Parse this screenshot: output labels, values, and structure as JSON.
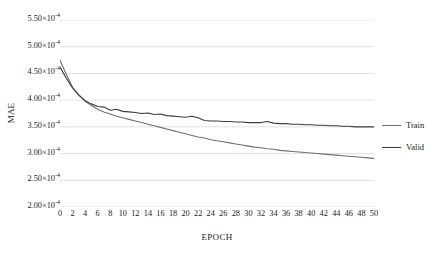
{
  "chart_data": {
    "type": "line",
    "title": "",
    "xlabel": "EPOCH",
    "ylabel": "MAE",
    "xlim": [
      0,
      50
    ],
    "ylim": [
      0.0002,
      0.00055
    ],
    "grid": "horizontal",
    "legend_position": "right",
    "y_tick_labels": [
      "5.50×10",
      "5.00×10",
      "4.50×10",
      "4.00×10",
      "3.50×10",
      "3.00×10",
      "2.50×10",
      "2.00×10"
    ],
    "y_tick_exponent": "-4",
    "y_tick_values": [
      0.00055,
      0.0005,
      0.00045,
      0.0004,
      0.00035,
      0.0003,
      0.00025,
      0.0002
    ],
    "x_tick_labels": [
      "0",
      "2",
      "4",
      "6",
      "8",
      "10",
      "12",
      "14",
      "16",
      "18",
      "20",
      "22",
      "24",
      "26",
      "28",
      "30",
      "32",
      "34",
      "36",
      "38",
      "40",
      "42",
      "44",
      "46",
      "48",
      "50"
    ],
    "x": [
      0,
      1,
      2,
      3,
      4,
      5,
      6,
      7,
      8,
      9,
      10,
      11,
      12,
      13,
      14,
      15,
      16,
      17,
      18,
      19,
      20,
      21,
      22,
      23,
      24,
      25,
      26,
      27,
      28,
      29,
      30,
      31,
      32,
      33,
      34,
      35,
      36,
      37,
      38,
      39,
      40,
      41,
      42,
      43,
      44,
      45,
      46,
      47,
      48,
      49,
      50
    ],
    "series": [
      {
        "name": "Train",
        "color": "#6f6f6f",
        "values": [
          0.000475,
          0.000448,
          0.000424,
          0.000409,
          0.000398,
          0.00039,
          0.000383,
          0.000378,
          0.000374,
          0.00037,
          0.000367,
          0.000364,
          0.000361,
          0.000358,
          0.000355,
          0.000352,
          0.000349,
          0.000346,
          0.000343,
          0.00034,
          0.000337,
          0.000334,
          0.000331,
          0.000329,
          0.000326,
          0.000324,
          0.000322,
          0.00032,
          0.000318,
          0.000316,
          0.000314,
          0.000312,
          0.000311,
          0.000309,
          0.000308,
          0.000306,
          0.000305,
          0.000304,
          0.000303,
          0.000302,
          0.000301,
          0.0003,
          0.000299,
          0.000298,
          0.000297,
          0.000296,
          0.000295,
          0.000294,
          0.000293,
          0.000292,
          0.000291
        ]
      },
      {
        "name": "Valid",
        "color": "#3c3c3c",
        "values": [
          0.000462,
          0.000441,
          0.000423,
          0.00041,
          0.000399,
          0.000393,
          0.000388,
          0.000387,
          0.000381,
          0.000383,
          0.000379,
          0.000378,
          0.000377,
          0.000375,
          0.000376,
          0.000373,
          0.000374,
          0.000371,
          0.00037,
          0.000369,
          0.000368,
          0.00037,
          0.000367,
          0.000362,
          0.000361,
          0.000361,
          0.00036,
          0.00036,
          0.000359,
          0.000359,
          0.000358,
          0.000358,
          0.000358,
          0.00036,
          0.000357,
          0.000356,
          0.000356,
          0.000355,
          0.000355,
          0.000354,
          0.000354,
          0.000353,
          0.000353,
          0.000352,
          0.000352,
          0.000351,
          0.000351,
          0.00035,
          0.00035,
          0.00035,
          0.00035
        ]
      }
    ]
  },
  "legend": {
    "entries": [
      {
        "label": "Train"
      },
      {
        "label": "Valid"
      }
    ]
  },
  "axes": {
    "y_title": "MAE",
    "x_title": "EPOCH"
  },
  "style": {
    "gridline_color": "#d9d9d9",
    "background": "#ffffff",
    "text_color": "#1a1a1a"
  }
}
